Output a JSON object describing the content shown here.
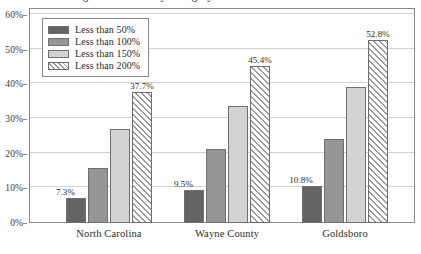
{
  "chart_data": {
    "type": "bar",
    "title": "Housing Cost Burden by Category",
    "categories": [
      "North Carolina",
      "Wayne County",
      "Goldsboro"
    ],
    "series": [
      {
        "name": "Less than 50%",
        "values": [
          7.3,
          9.5,
          10.8
        ],
        "labels": [
          "7.3%",
          "9.5%",
          "10.8%"
        ],
        "color": "#646464"
      },
      {
        "name": "Less than 100%",
        "values": [
          16.0,
          21.2,
          24.2
        ],
        "labels": [
          "",
          "",
          ""
        ],
        "color": "#969696"
      },
      {
        "name": "Less than 150%",
        "values": [
          27.0,
          33.8,
          39.2
        ],
        "labels": [
          "",
          "",
          ""
        ],
        "color": "#d3d3d3"
      },
      {
        "name": "Less than 200%",
        "values": [
          37.7,
          45.4,
          52.8
        ],
        "labels": [
          "37.7%",
          "45.4%",
          "52.8%"
        ],
        "color": "#ffffff"
      }
    ],
    "xlabel": "",
    "ylabel": "",
    "ylim": [
      0,
      62
    ],
    "yticks": [
      0,
      10,
      20,
      30,
      40,
      50,
      60
    ],
    "ytick_labels": [
      "0%",
      "10%",
      "20%",
      "30%",
      "40%",
      "50%",
      "60%"
    ],
    "grid": true,
    "legend_position": "top-left"
  },
  "legend": {
    "items": [
      {
        "label": "Less than 50%"
      },
      {
        "label": "Less than 100%"
      },
      {
        "label": "Less than 150%"
      },
      {
        "label": "Less than 200%"
      }
    ]
  }
}
